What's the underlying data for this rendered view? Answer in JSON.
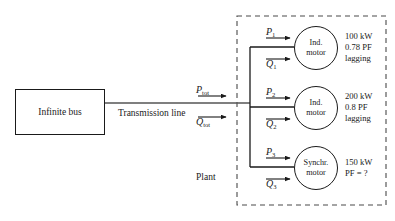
{
  "diagram": {
    "source_block": {
      "label": "Infinite bus"
    },
    "transmission": {
      "label": "Transmission line",
      "total_real_power_symbol": "P",
      "total_real_power_subscript": "tot",
      "total_reactive_power_symbol": "Q",
      "total_reactive_power_subscript": "tot"
    },
    "plant": {
      "label": "Plant",
      "boundary_style": "dashed"
    },
    "branches": [
      {
        "real_power_symbol": "P",
        "real_power_subscript": "1",
        "reactive_power_symbol": "Q",
        "reactive_power_subscript": "1",
        "machine_line_1": "Ind.",
        "machine_line_2": "motor",
        "spec_line_1": "100 kW",
        "spec_line_2": "0.78 PF",
        "spec_line_3": "lagging"
      },
      {
        "real_power_symbol": "P",
        "real_power_subscript": "2",
        "reactive_power_symbol": "Q",
        "reactive_power_subscript": "2",
        "machine_line_1": "Ind.",
        "machine_line_2": "motor",
        "spec_line_1": "200 kW",
        "spec_line_2": "0.8 PF",
        "spec_line_3": "lagging"
      },
      {
        "real_power_symbol": "P",
        "real_power_subscript": "3",
        "reactive_power_symbol": "Q",
        "reactive_power_subscript": "3",
        "machine_line_1": "Synchr.",
        "machine_line_2": "motor",
        "spec_line_1": "150 kW",
        "spec_line_2": "PF = ?",
        "spec_line_3": ""
      }
    ],
    "colors": {
      "background": "#ffffff",
      "stroke": "#1a1a1a",
      "text": "#1a1a1a"
    }
  }
}
